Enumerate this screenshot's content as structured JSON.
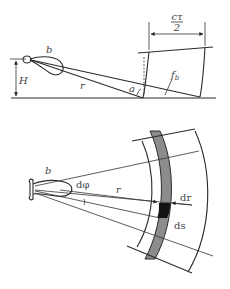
{
  "top_diagram": {
    "labels": {
      "beam": "b",
      "height": "H",
      "range": "r",
      "angle": "a",
      "footprint": "f",
      "footprint_sub": "b",
      "range_cell_num": "cτ",
      "range_cell_den": "2"
    }
  },
  "bottom_diagram": {
    "labels": {
      "beam": "b",
      "azimuth_step": "dφ",
      "range": "r",
      "range_step": "dr",
      "area_element": "ds"
    },
    "colors": {
      "annulus_fill": "#8c8c8c",
      "cell_fill": "#111111"
    }
  }
}
